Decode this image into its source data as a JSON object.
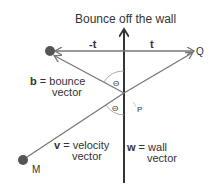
{
  "title": "Bounce off the wall",
  "labels": {
    "neg_t": "-t",
    "t": "t",
    "Q": "Q",
    "P": "P",
    "M": "M",
    "theta_upper": "Θ",
    "theta_lower": "Θ"
  },
  "vectors": {
    "b": {
      "symbol": "b",
      "eq": " = bounce",
      "line2": "vector"
    },
    "v": {
      "symbol": "v",
      "eq": " = velocity",
      "line2": "vector"
    },
    "w": {
      "symbol": "w",
      "eq": " = wall",
      "line2": "vector"
    }
  },
  "colors": {
    "line": "#777777",
    "wall": "#333333",
    "ball": "#555555",
    "text": "#333333"
  }
}
